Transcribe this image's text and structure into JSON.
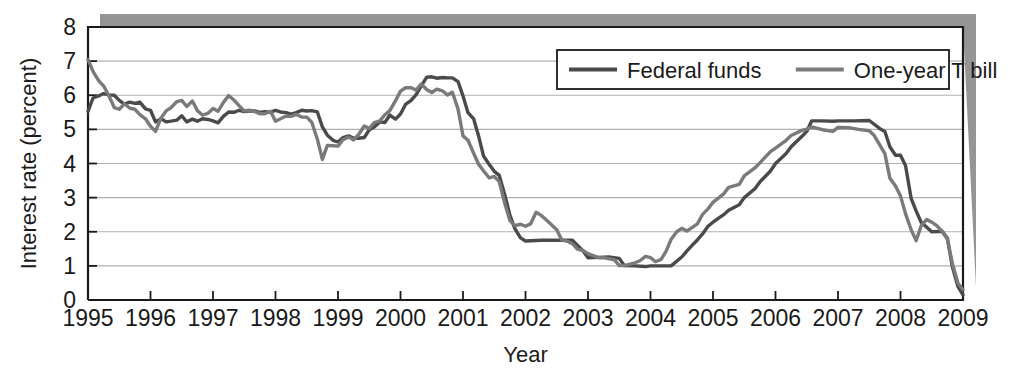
{
  "chart_data": {
    "type": "line",
    "title": "",
    "xlabel": "Year",
    "ylabel": "Interest rate (percent)",
    "xlim": [
      1995,
      2009
    ],
    "ylim": [
      0,
      8
    ],
    "ytick_values": [
      0,
      1,
      2,
      3,
      4,
      5,
      6,
      7,
      8
    ],
    "ytick_labels": [
      "0",
      "1",
      "2",
      "3",
      "4",
      "5",
      "6",
      "7",
      "8"
    ],
    "xtick_values": [
      1995,
      1996,
      1997,
      1998,
      1999,
      2000,
      2001,
      2002,
      2003,
      2004,
      2005,
      2006,
      2007,
      2008,
      2009
    ],
    "xtick_labels": [
      "1995",
      "1996",
      "1997",
      "1998",
      "1999",
      "2000",
      "2001",
      "2002",
      "2003",
      "2004",
      "2005",
      "2006",
      "2007",
      "2008",
      "2009"
    ],
    "grid": "horizontal",
    "legend_position": "top-right",
    "colors": {
      "federal_funds": "#4a4a4a",
      "one_year_tbill": "#7a7a7a",
      "gridline": "#b0b0b0",
      "axis": "#1a1a1a",
      "frame_shadow": "#8c8c8c"
    },
    "series": [
      {
        "name": "Federal funds",
        "color": "#4a4a4a",
        "x": [
          1995.0,
          1995.08,
          1995.17,
          1995.25,
          1995.33,
          1995.42,
          1995.5,
          1995.58,
          1995.67,
          1995.75,
          1995.83,
          1995.92,
          1996.0,
          1996.08,
          1996.17,
          1996.25,
          1996.33,
          1996.42,
          1996.5,
          1996.58,
          1996.67,
          1996.75,
          1996.83,
          1996.92,
          1997.0,
          1997.08,
          1997.17,
          1997.25,
          1997.33,
          1997.42,
          1997.5,
          1997.58,
          1997.67,
          1997.75,
          1997.83,
          1997.92,
          1998.0,
          1998.08,
          1998.17,
          1998.25,
          1998.33,
          1998.42,
          1998.5,
          1998.58,
          1998.67,
          1998.75,
          1998.83,
          1998.92,
          1999.0,
          1999.08,
          1999.17,
          1999.25,
          1999.33,
          1999.42,
          1999.5,
          1999.58,
          1999.67,
          1999.75,
          1999.83,
          1999.92,
          2000.0,
          2000.08,
          2000.17,
          2000.25,
          2000.33,
          2000.42,
          2000.5,
          2000.58,
          2000.67,
          2000.75,
          2000.83,
          2000.92,
          2001.0,
          2001.08,
          2001.17,
          2001.25,
          2001.33,
          2001.42,
          2001.5,
          2001.58,
          2001.67,
          2001.75,
          2001.83,
          2001.92,
          2002.0,
          2002.25,
          2002.5,
          2002.75,
          2002.92,
          2003.0,
          2003.17,
          2003.33,
          2003.5,
          2003.58,
          2003.75,
          2003.92,
          2004.0,
          2004.17,
          2004.33,
          2004.5,
          2004.58,
          2004.67,
          2004.75,
          2004.83,
          2004.92,
          2005.0,
          2005.17,
          2005.25,
          2005.42,
          2005.5,
          2005.67,
          2005.75,
          2005.92,
          2006.0,
          2006.17,
          2006.25,
          2006.42,
          2006.5,
          2006.58,
          2006.75,
          2006.92,
          2007.0,
          2007.25,
          2007.5,
          2007.67,
          2007.75,
          2007.83,
          2007.92,
          2008.0,
          2008.08,
          2008.17,
          2008.25,
          2008.33,
          2008.5,
          2008.67,
          2008.75,
          2008.83,
          2008.92,
          2009.0
        ],
        "y": [
          5.53,
          5.92,
          5.98,
          6.05,
          6.01,
          6.0,
          5.85,
          5.74,
          5.8,
          5.76,
          5.8,
          5.6,
          5.56,
          5.22,
          5.31,
          5.22,
          5.24,
          5.27,
          5.4,
          5.22,
          5.3,
          5.24,
          5.31,
          5.29,
          5.25,
          5.19,
          5.39,
          5.51,
          5.5,
          5.56,
          5.52,
          5.54,
          5.54,
          5.5,
          5.52,
          5.5,
          5.56,
          5.51,
          5.49,
          5.45,
          5.49,
          5.56,
          5.54,
          5.55,
          5.51,
          5.07,
          4.83,
          4.68,
          4.63,
          4.76,
          4.81,
          4.74,
          4.74,
          4.76,
          4.99,
          5.07,
          5.22,
          5.2,
          5.42,
          5.3,
          5.45,
          5.73,
          5.85,
          6.02,
          6.27,
          6.53,
          6.54,
          6.5,
          6.52,
          6.51,
          6.51,
          6.4,
          5.98,
          5.49,
          5.31,
          4.8,
          4.21,
          3.97,
          3.77,
          3.65,
          3.07,
          2.49,
          2.09,
          1.82,
          1.73,
          1.75,
          1.75,
          1.75,
          1.44,
          1.24,
          1.25,
          1.26,
          1.22,
          1.01,
          1.0,
          0.98,
          1.0,
          1.0,
          1.0,
          1.26,
          1.43,
          1.61,
          1.76,
          1.93,
          2.16,
          2.28,
          2.5,
          2.63,
          2.79,
          3.0,
          3.26,
          3.46,
          3.78,
          4.0,
          4.29,
          4.49,
          4.79,
          4.94,
          5.25,
          5.25,
          5.24,
          5.25,
          5.25,
          5.26,
          5.02,
          4.94,
          4.49,
          4.24,
          4.24,
          3.94,
          2.98,
          2.61,
          2.28,
          2.0,
          2.01,
          1.81,
          0.97,
          0.39,
          0.15
        ],
        "last_value": 0.15,
        "peak_value": 6.54,
        "min_value": 0.15
      },
      {
        "name": "One-year T bill",
        "color": "#7a7a7a",
        "x": [
          1995.0,
          1995.08,
          1995.17,
          1995.25,
          1995.33,
          1995.42,
          1995.5,
          1995.58,
          1995.67,
          1995.75,
          1995.83,
          1995.92,
          1996.0,
          1996.08,
          1996.17,
          1996.25,
          1996.33,
          1996.42,
          1996.5,
          1996.58,
          1996.67,
          1996.75,
          1996.83,
          1996.92,
          1997.0,
          1997.08,
          1997.17,
          1997.25,
          1997.33,
          1997.42,
          1997.5,
          1997.58,
          1997.67,
          1997.75,
          1997.83,
          1997.92,
          1998.0,
          1998.08,
          1998.17,
          1998.25,
          1998.33,
          1998.42,
          1998.5,
          1998.58,
          1998.67,
          1998.75,
          1998.83,
          1998.92,
          1999.0,
          1999.08,
          1999.17,
          1999.25,
          1999.33,
          1999.42,
          1999.5,
          1999.58,
          1999.67,
          1999.75,
          1999.83,
          1999.92,
          2000.0,
          2000.08,
          2000.17,
          2000.25,
          2000.33,
          2000.42,
          2000.5,
          2000.58,
          2000.67,
          2000.75,
          2000.83,
          2000.92,
          2001.0,
          2001.08,
          2001.17,
          2001.25,
          2001.33,
          2001.42,
          2001.5,
          2001.58,
          2001.67,
          2001.75,
          2001.83,
          2001.92,
          2002.0,
          2002.08,
          2002.17,
          2002.25,
          2002.33,
          2002.42,
          2002.5,
          2002.58,
          2002.67,
          2002.75,
          2002.83,
          2002.92,
          2003.0,
          2003.17,
          2003.25,
          2003.42,
          2003.5,
          2003.58,
          2003.75,
          2003.83,
          2003.92,
          2004.0,
          2004.08,
          2004.17,
          2004.25,
          2004.33,
          2004.42,
          2004.5,
          2004.58,
          2004.67,
          2004.75,
          2004.83,
          2004.92,
          2005.0,
          2005.17,
          2005.25,
          2005.42,
          2005.5,
          2005.67,
          2005.75,
          2005.92,
          2006.0,
          2006.17,
          2006.25,
          2006.42,
          2006.5,
          2006.58,
          2006.75,
          2006.92,
          2007.0,
          2007.17,
          2007.33,
          2007.5,
          2007.58,
          2007.67,
          2007.75,
          2007.83,
          2007.92,
          2008.0,
          2008.08,
          2008.17,
          2008.25,
          2008.33,
          2008.42,
          2008.5,
          2008.58,
          2008.67,
          2008.75,
          2008.83,
          2008.92,
          2009.0
        ],
        "y": [
          7.05,
          6.7,
          6.43,
          6.27,
          6.0,
          5.64,
          5.59,
          5.75,
          5.62,
          5.59,
          5.43,
          5.31,
          5.09,
          4.94,
          5.34,
          5.54,
          5.64,
          5.81,
          5.85,
          5.67,
          5.83,
          5.55,
          5.42,
          5.47,
          5.61,
          5.53,
          5.8,
          5.99,
          5.87,
          5.69,
          5.54,
          5.56,
          5.52,
          5.46,
          5.46,
          5.53,
          5.24,
          5.31,
          5.39,
          5.38,
          5.44,
          5.36,
          5.36,
          5.21,
          4.71,
          4.12,
          4.53,
          4.52,
          4.51,
          4.7,
          4.78,
          4.69,
          4.85,
          5.1,
          5.03,
          5.2,
          5.25,
          5.43,
          5.55,
          5.84,
          6.12,
          6.22,
          6.22,
          6.15,
          6.33,
          6.17,
          6.08,
          6.18,
          6.13,
          6.01,
          6.09,
          5.6,
          4.81,
          4.68,
          4.3,
          3.98,
          3.78,
          3.58,
          3.62,
          3.47,
          2.82,
          2.33,
          2.18,
          2.22,
          2.16,
          2.23,
          2.57,
          2.48,
          2.35,
          2.2,
          2.06,
          1.76,
          1.72,
          1.65,
          1.49,
          1.45,
          1.36,
          1.24,
          1.24,
          1.18,
          1.01,
          1.01,
          1.09,
          1.15,
          1.28,
          1.24,
          1.12,
          1.19,
          1.43,
          1.78,
          2.0,
          2.1,
          2.02,
          2.13,
          2.23,
          2.5,
          2.67,
          2.86,
          3.11,
          3.3,
          3.39,
          3.64,
          3.87,
          4.02,
          4.35,
          4.45,
          4.68,
          4.82,
          4.97,
          5.01,
          5.07,
          4.99,
          4.94,
          5.06,
          5.05,
          5.0,
          4.96,
          4.82,
          4.54,
          4.29,
          3.57,
          3.34,
          3.05,
          2.53,
          2.06,
          1.74,
          2.17,
          2.36,
          2.28,
          2.18,
          2.0,
          1.78,
          1.07,
          0.49,
          0.3
        ],
        "last_value": 0.3,
        "peak_value": 7.05,
        "min_value": 0.3
      }
    ],
    "legend": [
      {
        "label": "Federal funds",
        "color": "#4a4a4a"
      },
      {
        "label": "One-year T bill",
        "color": "#7a7a7a"
      }
    ]
  }
}
